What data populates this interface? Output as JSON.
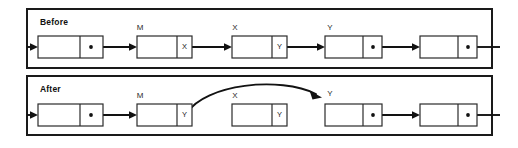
{
  "figure": {
    "type": "linked-list-diagram",
    "background_color": "#ffffff",
    "line_color": "#121212",
    "box_fill": "#ffffff",
    "box_stroke": "#2b2b2b"
  },
  "panels": [
    {
      "id": "before",
      "title": "Before",
      "nodes": [
        {
          "id": "b-n0",
          "label": "",
          "pointer_cell": "dot",
          "pointer_text": "",
          "x": 38,
          "y": 36,
          "width": 65,
          "height": 22,
          "divider_x": 80
        },
        {
          "id": "b-n1",
          "label": "M",
          "pointer_cell": "text",
          "pointer_text": "X",
          "x": 137,
          "y": 36,
          "width": 55,
          "height": 22,
          "divider_x": 177
        },
        {
          "id": "b-n2",
          "label": "X",
          "pointer_cell": "text",
          "pointer_text": "Y",
          "x": 232,
          "y": 36,
          "width": 55,
          "height": 22,
          "divider_x": 272
        },
        {
          "id": "b-n3",
          "label": "Y",
          "pointer_cell": "dot",
          "pointer_text": "",
          "x": 325,
          "y": 36,
          "width": 57,
          "height": 22,
          "divider_x": 363
        },
        {
          "id": "b-n4",
          "label": "",
          "pointer_cell": "dot",
          "pointer_text": "",
          "x": 420,
          "y": 36,
          "width": 57,
          "height": 22,
          "divider_x": 458
        }
      ],
      "links": [
        {
          "from": "head",
          "to": "b-n0",
          "style": "straight"
        },
        {
          "from": "b-n0",
          "to": "b-n1",
          "style": "straight"
        },
        {
          "from": "b-n1",
          "to": "b-n2",
          "style": "straight"
        },
        {
          "from": "b-n2",
          "to": "b-n3",
          "style": "straight"
        },
        {
          "from": "b-n3",
          "to": "b-n4",
          "style": "straight"
        },
        {
          "from": "b-n4",
          "to": "edge",
          "style": "straight"
        }
      ]
    },
    {
      "id": "after",
      "title": "After",
      "nodes": [
        {
          "id": "a-n0",
          "label": "",
          "pointer_cell": "dot",
          "pointer_text": "",
          "x": 38,
          "y": 104,
          "width": 65,
          "height": 22,
          "divider_x": 80
        },
        {
          "id": "a-n1",
          "label": "M",
          "pointer_cell": "text",
          "pointer_text": "Y",
          "x": 137,
          "y": 104,
          "width": 55,
          "height": 22,
          "divider_x": 177
        },
        {
          "id": "a-n2",
          "label": "X",
          "pointer_cell": "text",
          "pointer_text": "Y",
          "x": 232,
          "y": 104,
          "width": 55,
          "height": 22,
          "divider_x": 272
        },
        {
          "id": "a-n3",
          "label": "Y",
          "pointer_cell": "dot",
          "pointer_text": "",
          "x": 325,
          "y": 104,
          "width": 57,
          "height": 22,
          "divider_x": 363
        },
        {
          "id": "a-n4",
          "label": "",
          "pointer_cell": "dot",
          "pointer_text": "",
          "x": 420,
          "y": 104,
          "width": 57,
          "height": 22,
          "divider_x": 458
        }
      ],
      "links": [
        {
          "from": "head",
          "to": "a-n0",
          "style": "straight"
        },
        {
          "from": "a-n0",
          "to": "a-n1",
          "style": "straight"
        },
        {
          "from": "a-n1",
          "to": "a-n3",
          "style": "curved"
        },
        {
          "from": "a-n3",
          "to": "a-n4",
          "style": "straight"
        },
        {
          "from": "a-n4",
          "to": "edge",
          "style": "straight"
        }
      ]
    }
  ],
  "labels": {
    "before_title": "Before",
    "after_title": "After",
    "m_before": "M",
    "x_before": "X",
    "y_before": "Y",
    "m_after": "M",
    "x_after": "X",
    "y_after": "Y",
    "cell_m_before": "X",
    "cell_x_before": "Y",
    "cell_m_after": "Y",
    "cell_x_after": "Y"
  }
}
